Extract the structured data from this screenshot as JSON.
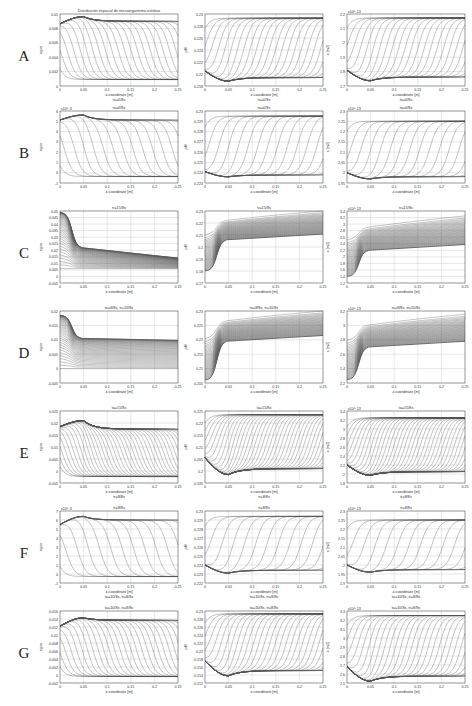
{
  "figure": {
    "rows": [
      {
        "label": "A",
        "top": 0
      },
      {
        "label": "B",
        "top": 97
      },
      {
        "label": "C",
        "top": 197
      },
      {
        "label": "D",
        "top": 297
      },
      {
        "label": "E",
        "top": 397
      },
      {
        "label": "F",
        "top": 497
      },
      {
        "label": "G",
        "top": 597
      }
    ],
    "columns": [
      {
        "left": 60,
        "ylabel": "agua"
      },
      {
        "left": 205,
        "ylabel": "pH"
      },
      {
        "left": 347,
        "ylabel": "s [m2]"
      }
    ],
    "x_axis_label": "z-coordinate [m]",
    "x_ticks": [
      "0",
      "0.05",
      "0.1",
      "0.15",
      "0.2",
      "0.25"
    ],
    "colors": {
      "line": "#555555",
      "grid": "#cfcfcf",
      "frame": "#333333",
      "text": "#333333"
    }
  },
  "chart_data": [
    {
      "row": "A",
      "col": 1,
      "type": "line",
      "title": "Distribución espacial de microorganismo estático",
      "subtitle_below": "ta=0/8s",
      "xlabel": "z-coordinate [m]",
      "ylabel": "agua",
      "ylim": [
        0,
        0.011
      ],
      "yticks": [
        "0",
        "0.002",
        "0.004",
        "0.006",
        "0.008",
        "0.01"
      ],
      "exponent": "",
      "shape": "decay",
      "start": 0.0095,
      "peak": 0.0106,
      "plateau": 0.0099,
      "n_curves": 24
    },
    {
      "row": "A",
      "col": 2,
      "type": "line",
      "title": "",
      "subtitle_below": "ta=0/8s",
      "xlabel": "z-coordinate [m]",
      "ylabel": "pH",
      "ylim": [
        0.218,
        0.23
      ],
      "yticks": [
        "0.218",
        "0.22",
        "0.222",
        "0.224",
        "0.226",
        "0.228",
        "0.23"
      ],
      "exponent": "",
      "shape": "rise",
      "start": 0.2205,
      "dip": 0.2188,
      "plateau": 0.2293,
      "n_curves": 24
    },
    {
      "row": "A",
      "col": 3,
      "type": "line",
      "title": "",
      "subtitle_below": "ta=0/8s",
      "xlabel": "z-coordinate [m]",
      "ylabel": "s [m2]",
      "ylim": [
        1.7,
        2.25
      ],
      "yticks": [
        "1.7",
        "1.8",
        "1.9",
        "2",
        "2.1",
        "2.2"
      ],
      "exponent": "x10^-13",
      "shape": "rise",
      "start": 1.82,
      "dip": 1.74,
      "plateau": 2.22,
      "n_curves": 24
    },
    {
      "row": "B",
      "col": 1,
      "type": "line",
      "title": "ta=0/8s",
      "subtitle_below": "",
      "xlabel": "z-coordinate [m]",
      "ylabel": "agua",
      "ylim": [
        -1,
        6.2
      ],
      "yticks": [
        "-1",
        "0",
        "1",
        "2",
        "3",
        "4",
        "5",
        "6"
      ],
      "exponent": "x10^-3",
      "shape": "decay",
      "start": 5.3,
      "peak": 5.8,
      "plateau": 5.3,
      "n_curves": 16
    },
    {
      "row": "B",
      "col": 2,
      "type": "line",
      "title": "ta=0/8s",
      "subtitle_below": "",
      "xlabel": "z-coordinate [m]",
      "ylabel": "pH",
      "ylim": [
        0.223,
        0.23
      ],
      "yticks": [
        "0.223",
        "0.224",
        "0.225",
        "0.226",
        "0.227",
        "0.228",
        "0.229",
        "0.23"
      ],
      "exponent": "",
      "shape": "rise",
      "start": 0.2241,
      "dip": 0.2236,
      "plateau": 0.2295,
      "n_curves": 16
    },
    {
      "row": "B",
      "col": 3,
      "type": "line",
      "title": "ta=0/8s",
      "subtitle_below": "",
      "xlabel": "z-coordinate [m]",
      "ylabel": "s [m2]",
      "ylim": [
        1.95,
        2.3
      ],
      "yticks": [
        "1.95",
        "2",
        "2.05",
        "2.1",
        "2.15",
        "2.2",
        "2.25",
        "2.3"
      ],
      "exponent": "x10^-13",
      "shape": "rise",
      "start": 2.0,
      "dip": 1.97,
      "plateau": 2.25,
      "n_curves": 16
    },
    {
      "row": "C",
      "col": 1,
      "type": "line",
      "title": "tr=15/8s",
      "subtitle_below": "",
      "xlabel": "z-coordinate [m]",
      "ylabel": "agua",
      "ylim": [
        -0.005,
        0.05
      ],
      "yticks": [
        "-0.005",
        "0",
        "0.005",
        "0.01",
        "0.015",
        "0.02",
        "0.025",
        "0.03",
        "0.035",
        "0.04",
        "0.045",
        "0.05"
      ],
      "exponent": "",
      "shape": "front_decay",
      "start": 0.049,
      "front": 0.022,
      "plateau": 0.014,
      "n_curves": 40
    },
    {
      "row": "C",
      "col": 2,
      "type": "line",
      "title": "tr=15/8s",
      "subtitle_below": "",
      "xlabel": "z-coordinate [m]",
      "ylabel": "pH",
      "ylim": [
        0.17,
        0.23
      ],
      "yticks": [
        "0.17",
        "0.18",
        "0.19",
        "0.2",
        "0.21",
        "0.22",
        "0.23"
      ],
      "exponent": "",
      "shape": "front_rise",
      "start": 0.18,
      "front": 0.206,
      "plateau": 0.23,
      "n_curves": 40
    },
    {
      "row": "C",
      "col": 3,
      "type": "line",
      "title": "tr=15/8s",
      "subtitle_below": "",
      "xlabel": "z-coordinate [m]",
      "ylabel": "s [m2]",
      "ylim": [
        1.2,
        3.4
      ],
      "yticks": [
        "1.2",
        "1.4",
        "1.6",
        "1.8",
        "2",
        "2.2",
        "2.4",
        "2.6",
        "2.8",
        "3",
        "3.2",
        "3.4"
      ],
      "exponent": "x10^-13",
      "shape": "front_rise",
      "start": 1.4,
      "front": 2.2,
      "plateau": 3.25,
      "n_curves": 40
    },
    {
      "row": "D",
      "col": 1,
      "type": "line",
      "title": "ta=8/8s, tr=10/8s",
      "subtitle_below": "",
      "xlabel": "z-coordinate [m]",
      "ylabel": "agua",
      "ylim": [
        -0.005,
        0.02
      ],
      "yticks": [
        "-0.005",
        "0",
        "0.005",
        "0.01",
        "0.015",
        "0.02"
      ],
      "exponent": "",
      "shape": "front_decay",
      "start": 0.0185,
      "front": 0.0105,
      "plateau": 0.0098,
      "n_curves": 40
    },
    {
      "row": "D",
      "col": 2,
      "type": "line",
      "title": "ta=8/8s, tr=10/8s",
      "subtitle_below": "",
      "xlabel": "z-coordinate [m]",
      "ylabel": "pH",
      "ylim": [
        0.205,
        0.23
      ],
      "yticks": [
        "0.205",
        "0.21",
        "0.215",
        "0.22",
        "0.225",
        "0.23"
      ],
      "exponent": "",
      "shape": "front_rise",
      "start": 0.206,
      "front": 0.2195,
      "plateau": 0.23,
      "n_curves": 40
    },
    {
      "row": "D",
      "col": 3,
      "type": "line",
      "title": "ta=8/8s, tr=10/8s",
      "subtitle_below": "",
      "xlabel": "z-coordinate [m]",
      "ylabel": "s [m2]",
      "ylim": [
        2.2,
        3.3
      ],
      "yticks": [
        "2.2",
        "2.4",
        "2.6",
        "2.8",
        "3",
        "3.2"
      ],
      "exponent": "x10^-13",
      "shape": "front_rise",
      "start": 2.25,
      "front": 2.75,
      "plateau": 3.25,
      "n_curves": 40
    },
    {
      "row": "E",
      "col": 1,
      "type": "line",
      "title": "ta=15/8s",
      "subtitle_below": "tr=8/8s",
      "xlabel": "z-coordinate [m]",
      "ylabel": "agua",
      "ylim": [
        -0.005,
        0.025
      ],
      "yticks": [
        "-0.005",
        "0",
        "0.005",
        "0.01",
        "0.015",
        "0.02",
        "0.025"
      ],
      "exponent": "",
      "shape": "decay",
      "start": 0.0185,
      "peak": 0.021,
      "plateau": 0.0175,
      "n_curves": 40
    },
    {
      "row": "E",
      "col": 2,
      "type": "line",
      "title": "ta=15/8s",
      "subtitle_below": "tr=8/8s",
      "xlabel": "z-coordinate [m]",
      "ylabel": "pH",
      "ylim": [
        0.195,
        0.225
      ],
      "yticks": [
        "0.195",
        "0.2",
        "0.205",
        "0.21",
        "0.215",
        "0.22",
        "0.225"
      ],
      "exponent": "",
      "shape": "rise",
      "start": 0.2055,
      "dip": 0.1985,
      "plateau": 0.2235,
      "n_curves": 40
    },
    {
      "row": "E",
      "col": 3,
      "type": "line",
      "title": "ta=15/8s",
      "subtitle_below": "tr=8/8s",
      "xlabel": "z-coordinate [m]",
      "ylabel": "s [m2]",
      "ylim": [
        1.8,
        3.4
      ],
      "yticks": [
        "1.8",
        "2",
        "2.2",
        "2.4",
        "2.6",
        "2.8",
        "3",
        "3.2",
        "3.4"
      ],
      "exponent": "x10^-13",
      "shape": "rise",
      "start": 2.2,
      "dip": 1.97,
      "plateau": 3.25,
      "n_curves": 40
    },
    {
      "row": "F",
      "col": 1,
      "type": "line",
      "title": "tr=8/8s",
      "subtitle_below": "ta=10/8s, tr=8/8s",
      "xlabel": "z-coordinate [m]",
      "ylabel": "agua",
      "ylim": [
        -1,
        7
      ],
      "yticks": [
        "-1",
        "0",
        "1",
        "2",
        "3",
        "4",
        "5",
        "6",
        "7"
      ],
      "exponent": "x10^-3",
      "shape": "decay",
      "start": 5.5,
      "peak": 6.4,
      "plateau": 6.0,
      "n_curves": 14
    },
    {
      "row": "F",
      "col": 2,
      "type": "line",
      "title": "tr=8/8s",
      "subtitle_below": "ta=10/8s, tr=8/8s",
      "xlabel": "z-coordinate [m]",
      "ylabel": "pH",
      "ylim": [
        0.222,
        0.23
      ],
      "yticks": [
        "0.222",
        "0.223",
        "0.224",
        "0.225",
        "0.226",
        "0.227",
        "0.228",
        "0.229",
        "0.23"
      ],
      "exponent": "",
      "shape": "rise",
      "start": 0.224,
      "dip": 0.2231,
      "plateau": 0.2294,
      "n_curves": 14
    },
    {
      "row": "F",
      "col": 3,
      "type": "line",
      "title": "tr=8/8s",
      "subtitle_below": "ta=10/8s, tr=8/8s",
      "xlabel": "z-coordinate [m]",
      "ylabel": "s [m2]",
      "ylim": [
        1.9,
        2.3
      ],
      "yticks": [
        "1.9",
        "1.95",
        "2",
        "2.05",
        "2.1",
        "2.15",
        "2.2",
        "2.25",
        "2.3"
      ],
      "exponent": "x10^-13",
      "shape": "rise",
      "start": 2.0,
      "dip": 1.96,
      "plateau": 2.25,
      "n_curves": 14
    },
    {
      "row": "G",
      "col": 1,
      "type": "line",
      "title": "ta=10/8s, tr=8/8s",
      "subtitle_below": "",
      "xlabel": "z-coordinate [m]",
      "ylabel": "agua",
      "ylim": [
        -0.002,
        0.016
      ],
      "yticks": [
        "-0.002",
        "0",
        "0.002",
        "0.004",
        "0.006",
        "0.008",
        "0.01",
        "0.012",
        "0.014",
        "0.016"
      ],
      "exponent": "",
      "shape": "decay",
      "start": 0.0122,
      "peak": 0.0143,
      "plateau": 0.0137,
      "n_curves": 28
    },
    {
      "row": "G",
      "col": 2,
      "type": "line",
      "title": "ta=10/8s, tr=8/8s",
      "subtitle_below": "",
      "xlabel": "z-coordinate [m]",
      "ylabel": "pH",
      "ylim": [
        0.212,
        0.23
      ],
      "yticks": [
        "0.212",
        "0.214",
        "0.216",
        "0.218",
        "0.22",
        "0.222",
        "0.224",
        "0.226",
        "0.228",
        "0.23"
      ],
      "exponent": "",
      "shape": "rise",
      "start": 0.2175,
      "dip": 0.2138,
      "plateau": 0.2293,
      "n_curves": 28
    },
    {
      "row": "G",
      "col": 3,
      "type": "line",
      "title": "ta=10/8s, tr=8/8s",
      "subtitle_below": "",
      "xlabel": "z-coordinate [m]",
      "ylabel": "s [m2]",
      "ylim": [
        2.5,
        3.3
      ],
      "yticks": [
        "2.5",
        "2.6",
        "2.7",
        "2.8",
        "2.9",
        "3",
        "3.1",
        "3.2",
        "3.3"
      ],
      "exponent": "x10^-13",
      "shape": "rise",
      "start": 2.68,
      "dip": 2.52,
      "plateau": 3.25,
      "n_curves": 28
    }
  ]
}
